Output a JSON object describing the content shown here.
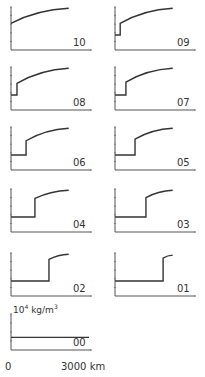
{
  "chart_data": {
    "type": "line",
    "title": "",
    "ylabel": "10^4 kg/m^3",
    "xlabel": "km",
    "x_tick_labels": [
      "0",
      "3000 km"
    ],
    "xlim": [
      0,
      3000
    ],
    "y_unit_label": "10",
    "y_unit_sup": "4",
    "y_unit_rest": " kg/m",
    "y_unit_sup2": "3",
    "layout": "small multiples, 2 columns x 5 rows + 1 bottom panel",
    "panels": [
      {
        "label": "10",
        "step_km": 0,
        "low_level": 0.62,
        "curve_start": 0.62,
        "curve_end": 0.97
      },
      {
        "label": "09",
        "step_km": 200,
        "low_level": 0.35,
        "curve_start": 0.62,
        "curve_end": 0.97
      },
      {
        "label": "08",
        "step_km": 230,
        "low_level": 0.35,
        "curve_start": 0.62,
        "curve_end": 0.97
      },
      {
        "label": "07",
        "step_km": 420,
        "low_level": 0.35,
        "curve_start": 0.65,
        "curve_end": 0.97
      },
      {
        "label": "06",
        "step_km": 580,
        "low_level": 0.35,
        "curve_start": 0.68,
        "curve_end": 0.97
      },
      {
        "label": "05",
        "step_km": 770,
        "low_level": 0.35,
        "curve_start": 0.72,
        "curve_end": 0.97
      },
      {
        "label": "04",
        "step_km": 920,
        "low_level": 0.35,
        "curve_start": 0.78,
        "curve_end": 0.97
      },
      {
        "label": "03",
        "step_km": 1190,
        "low_level": 0.35,
        "curve_start": 0.8,
        "curve_end": 0.97
      },
      {
        "label": "02",
        "step_km": 1460,
        "low_level": 0.35,
        "curve_start": 0.85,
        "curve_end": 0.97
      },
      {
        "label": "01",
        "step_km": 1850,
        "low_level": 0.35,
        "curve_start": 0.88,
        "curve_end": 0.95
      },
      {
        "label": "00",
        "step_km": 3000,
        "low_level": 0.35,
        "curve_start": 0.35,
        "curve_end": 0.35
      }
    ],
    "grid": false
  }
}
